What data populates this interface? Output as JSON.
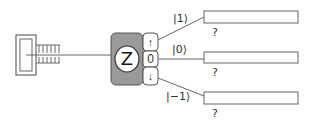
{
  "analyzer": {
    "label": "Z",
    "ports": {
      "up": "↑",
      "zero": "0",
      "down": "↓"
    },
    "body_color": "#999999"
  },
  "outputs": [
    {
      "state": "|1⟩",
      "result": "?"
    },
    {
      "state": "|0⟩",
      "result": "?"
    },
    {
      "state": "|−1⟩",
      "result": "?"
    }
  ],
  "colors": {
    "stroke": "#555555",
    "background": "#ffffff"
  }
}
